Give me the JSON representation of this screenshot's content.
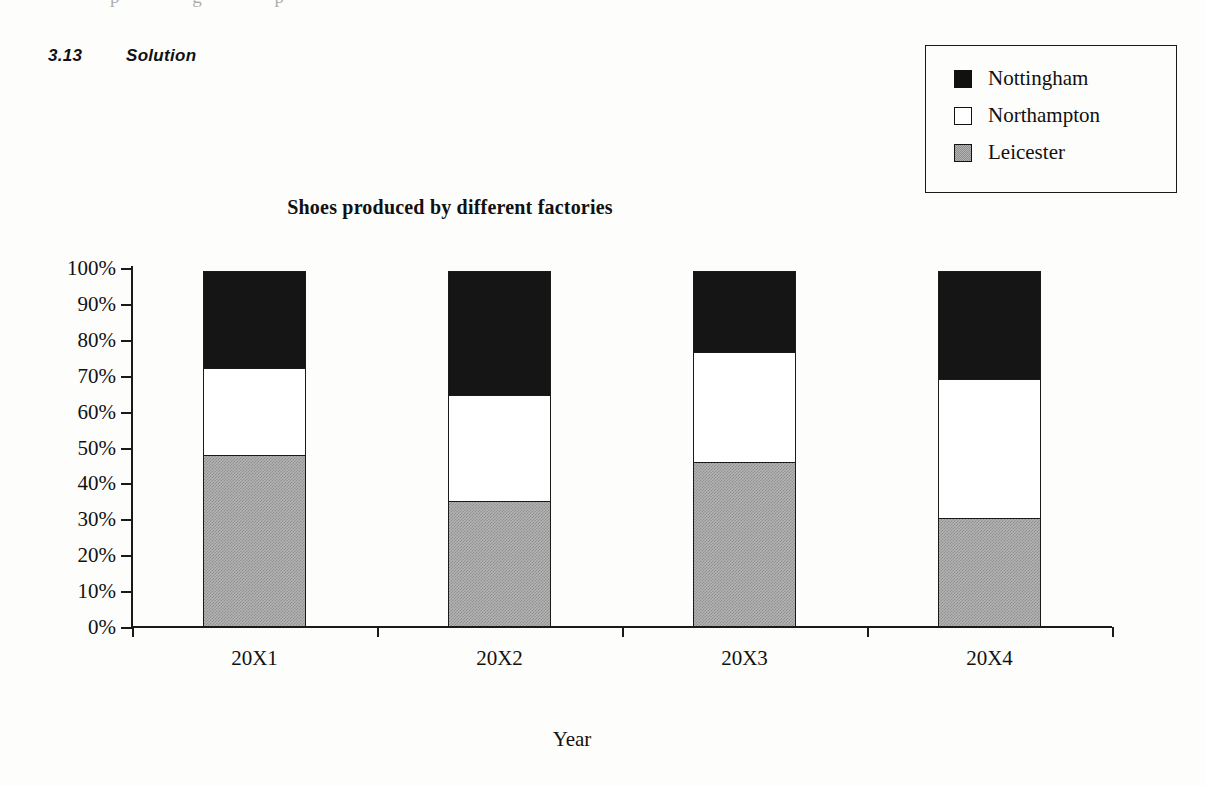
{
  "page": {
    "top_bleed_artifact": "p g p",
    "section": {
      "number": "3.13",
      "title": "Solution"
    }
  },
  "legend": {
    "position": "top-right-box",
    "items": [
      {
        "label": "Nottingham",
        "swatch": "black-square-icon",
        "color": "#151515"
      },
      {
        "label": "Northampton",
        "swatch": "white-square-icon",
        "color": "#ffffff"
      },
      {
        "label": "Leicester",
        "swatch": "gray-square-icon",
        "color": "#b4b4b4"
      }
    ]
  },
  "chart_data": {
    "type": "bar",
    "stacked": true,
    "stack_mode": "percent",
    "title": "Shoes produced by different factories",
    "xlabel": "Year",
    "ylabel": "",
    "categories": [
      "20X1",
      "20X2",
      "20X3",
      "20X4"
    ],
    "ylim": [
      0,
      100
    ],
    "ytick_labels": [
      "100%",
      "90%",
      "80%",
      "70%",
      "60%",
      "50%",
      "40%",
      "30%",
      "20%",
      "10%",
      "0%"
    ],
    "ytick_values": [
      100,
      90,
      80,
      70,
      60,
      50,
      40,
      30,
      20,
      10,
      0
    ],
    "grid": false,
    "legend_position": "outside-top-right",
    "series": [
      {
        "name": "Leicester",
        "color": "#b4b4b4",
        "values": [
          48.0,
          35.0,
          46.0,
          30.5
        ]
      },
      {
        "name": "Northampton",
        "color": "#ffffff",
        "values": [
          24.5,
          30.0,
          31.0,
          39.0
        ]
      },
      {
        "name": "Nottingham",
        "color": "#151515",
        "values": [
          27.5,
          35.0,
          23.0,
          30.5
        ]
      }
    ],
    "cumulative_tops": {
      "Leicester": [
        48.0,
        35.0,
        46.0,
        30.5
      ],
      "Northampton": [
        72.5,
        65.0,
        77.0,
        69.5
      ],
      "Nottingham": [
        100,
        100,
        100,
        100
      ]
    }
  }
}
